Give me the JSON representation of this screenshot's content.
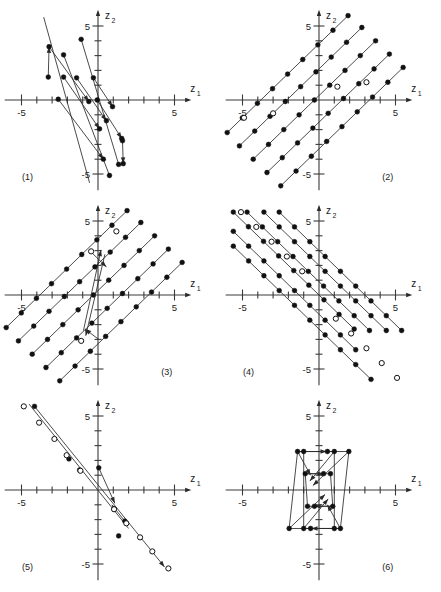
{
  "figure": {
    "title": "",
    "width": 441,
    "height": 592,
    "panel_count": 6,
    "background_color": "#ffffff",
    "ink_color": "#111111"
  },
  "axes_common": {
    "xlabel": "z",
    "xlabel_sub": "1",
    "ylabel": "z",
    "ylabel_sub": "2",
    "xlim": [
      -6.1,
      6.1
    ],
    "ylim": [
      -6.1,
      6.1
    ],
    "xticks": [
      -5,
      -4,
      -3,
      -2,
      -1,
      1,
      2,
      3,
      4,
      5
    ],
    "yticks": [
      -5,
      -4,
      -3,
      -2,
      -1,
      1,
      2,
      3,
      4,
      5
    ],
    "xtick_labels": [
      {
        "value": -5,
        "text": "-5"
      },
      {
        "value": 5,
        "text": "5"
      }
    ],
    "ytick_labels": [
      {
        "value": -5,
        "text": "-5"
      },
      {
        "value": 5,
        "text": "5"
      }
    ],
    "grid": false,
    "origin_centered": true
  },
  "chart_data": [
    {
      "id": "panel-1",
      "type": "scatter",
      "label": "(1)",
      "label_pos": [
        -4.6,
        -5.4
      ],
      "title": "",
      "xlabel": "z1",
      "ylabel": "z2",
      "xlim": [
        -6.1,
        6.1
      ],
      "ylim": [
        -6.1,
        6.1
      ],
      "description": "Steep negative-slope trajectories with filled markers and arrows",
      "segments": [
        {
          "points": [
            [
              -3.55,
              5.6
            ],
            [
              -0.55,
              -5.6
            ]
          ],
          "arrow": false
        },
        {
          "points": [
            [
              -2.25,
              3.05
            ],
            [
              0.75,
              -5.1
            ]
          ],
          "arrow": false
        },
        {
          "points": [
            [
              -1.1,
              4.1
            ],
            [
              1.35,
              -4.35
            ]
          ],
          "arrow": false
        },
        {
          "points": [
            [
              -3.25,
              1.55
            ],
            [
              -3.2,
              3.6
            ]
          ],
          "arrow": true
        },
        {
          "points": [
            [
              1.6,
              -2.75
            ],
            [
              1.65,
              -4.3
            ]
          ],
          "arrow": true
        },
        {
          "points": [
            [
              -3.2,
              3.6
            ],
            [
              -0.6,
              -0.1
            ]
          ],
          "arrow": true
        },
        {
          "points": [
            [
              -2.25,
              1.55
            ],
            [
              0.1,
              -1.95
            ]
          ],
          "arrow": true
        },
        {
          "points": [
            [
              -1.4,
              1.5
            ],
            [
              0.55,
              -1.4
            ]
          ],
          "arrow": true
        },
        {
          "points": [
            [
              -0.3,
              1.5
            ],
            [
              0.95,
              -0.45
            ]
          ],
          "arrow": true
        },
        {
          "points": [
            [
              -2.6,
              0.05
            ],
            [
              0.35,
              -4.0
            ]
          ],
          "arrow": true
        },
        {
          "points": [
            [
              -0.05,
              0.0
            ],
            [
              1.55,
              -2.6
            ]
          ],
          "arrow": true
        }
      ],
      "points_filled": [
        [
          -3.25,
          1.55
        ],
        [
          -3.2,
          3.6
        ],
        [
          -2.25,
          3.05
        ],
        [
          -2.25,
          1.55
        ],
        [
          -1.4,
          1.5
        ],
        [
          -1.1,
          4.1
        ],
        [
          -0.3,
          1.5
        ],
        [
          -0.6,
          -0.1
        ],
        [
          -2.6,
          0.05
        ],
        [
          -0.05,
          0.0
        ],
        [
          0.35,
          -4.0
        ],
        [
          0.55,
          -1.4
        ],
        [
          0.75,
          -5.1
        ],
        [
          0.95,
          -0.45
        ],
        [
          1.35,
          -4.35
        ],
        [
          1.55,
          -2.6
        ],
        [
          1.6,
          -2.75
        ],
        [
          1.65,
          -4.3
        ],
        [
          0.1,
          -1.95
        ]
      ],
      "points_open": []
    },
    {
      "id": "panel-2",
      "type": "scatter",
      "label": "(2)",
      "label_pos": [
        4.5,
        -5.4
      ],
      "title": "",
      "xlabel": "z1",
      "ylabel": "z2",
      "xlim": [
        -6.1,
        6.1
      ],
      "ylim": [
        -6.1,
        6.1
      ],
      "description": "Five parallel lines of slope 1 with unit-spaced filled lattice markers; selected open markers",
      "lines": [
        {
          "from": [
            -6.0,
            -2.2
          ],
          "to": [
            1.9,
            5.7
          ],
          "step": 1.0
        },
        {
          "from": [
            -5.2,
            -3.1
          ],
          "to": [
            2.8,
            4.9
          ],
          "step": 1.0
        },
        {
          "from": [
            -4.3,
            -4.0
          ],
          "to": [
            3.7,
            4.0
          ],
          "step": 1.0
        },
        {
          "from": [
            -3.4,
            -4.9
          ],
          "to": [
            4.6,
            3.1
          ],
          "step": 1.0
        },
        {
          "from": [
            -2.5,
            -5.8
          ],
          "to": [
            5.5,
            2.2
          ],
          "step": 1.0
        }
      ],
      "points_open": [
        [
          -4.9,
          -1.2
        ],
        [
          -3.0,
          -0.9
        ],
        [
          1.2,
          0.9
        ],
        [
          3.1,
          1.2
        ]
      ]
    },
    {
      "id": "panel-3",
      "type": "scatter",
      "label": "(3)",
      "label_pos": [
        4.5,
        -5.4
      ],
      "title": "",
      "xlabel": "z1",
      "ylabel": "z2",
      "xlim": [
        -6.1,
        6.1
      ],
      "ylim": [
        -6.1,
        6.1
      ],
      "description": "Slope-1 lattice lines as in panel 2 plus a narrow steep trajectory pair through origin",
      "lines": [
        {
          "from": [
            -6.0,
            -2.2
          ],
          "to": [
            1.9,
            5.7
          ],
          "step": 1.0
        },
        {
          "from": [
            -5.2,
            -3.1
          ],
          "to": [
            2.8,
            4.9
          ],
          "step": 1.0
        },
        {
          "from": [
            -4.3,
            -4.0
          ],
          "to": [
            3.7,
            4.0
          ],
          "step": 1.0
        },
        {
          "from": [
            -3.4,
            -4.9
          ],
          "to": [
            4.6,
            3.1
          ],
          "step": 1.0
        },
        {
          "from": [
            -2.5,
            -5.8
          ],
          "to": [
            5.5,
            2.2
          ],
          "step": 1.0
        }
      ],
      "points_open": [
        [
          -1.1,
          -3.1
        ],
        [
          -0.45,
          2.95
        ],
        [
          1.2,
          4.3
        ]
      ],
      "segments": [
        {
          "points": [
            [
              -0.95,
              -2.4
            ],
            [
              0.2,
              3.05
            ]
          ],
          "arrow": true
        },
        {
          "points": [
            [
              0.45,
              2.75
            ],
            [
              -0.8,
              -2.75
            ]
          ],
          "arrow": true
        },
        {
          "points": [
            [
              -0.5,
              2.95
            ],
            [
              0.55,
              1.9
            ]
          ],
          "arrow": true
        },
        {
          "points": [
            [
              0.05,
              -3.0
            ],
            [
              -0.85,
              -2.3
            ]
          ],
          "arrow": true
        }
      ]
    },
    {
      "id": "panel-4",
      "type": "scatter",
      "label": "(4)",
      "label_pos": [
        -4.6,
        -5.4
      ],
      "title": "",
      "xlabel": "z1",
      "ylabel": "z2",
      "xlim": [
        -6.1,
        6.1
      ],
      "ylim": [
        -6.1,
        6.1
      ],
      "description": "Five parallel lines of slope -1 with unit-spaced filled lattice markers; diagonal band of open markers",
      "lines": [
        {
          "from": [
            -5.6,
            5.6
          ],
          "to": [
            2.3,
            -2.3
          ],
          "step": 1.0
        },
        {
          "from": [
            -4.7,
            5.6
          ],
          "to": [
            3.3,
            -2.4
          ],
          "step": 1.0
        },
        {
          "from": [
            -5.6,
            4.3
          ],
          "to": [
            2.4,
            -3.7
          ],
          "step": 1.0
        },
        {
          "from": [
            -5.6,
            3.3
          ],
          "to": [
            3.4,
            -5.7
          ],
          "step": 1.0
        },
        {
          "from": [
            -3.6,
            5.6
          ],
          "to": [
            4.4,
            -2.4
          ],
          "step": 1.0
        },
        {
          "from": [
            -2.6,
            5.6
          ],
          "to": [
            5.4,
            -2.4
          ],
          "step": 1.0
        }
      ],
      "points_open": [
        [
          -5.1,
          5.6
        ],
        [
          -4.1,
          4.6
        ],
        [
          -3.1,
          3.6
        ],
        [
          -2.1,
          2.6
        ],
        [
          -1.1,
          1.6
        ],
        [
          1.1,
          -1.6
        ],
        [
          2.1,
          -2.6
        ],
        [
          3.1,
          -3.6
        ],
        [
          4.1,
          -4.6
        ],
        [
          5.1,
          -5.6
        ]
      ]
    },
    {
      "id": "panel-5",
      "type": "scatter",
      "label": "(5)",
      "label_pos": [
        -4.6,
        -5.4
      ],
      "title": "",
      "xlabel": "z1",
      "ylabel": "z2",
      "xlim": [
        -6.1,
        6.1
      ],
      "ylim": [
        -6.1,
        6.1
      ],
      "description": "Negative-slope line of open markers from upper-left to lower-right, with shorter filled-marker trajectory and arrows",
      "segments": [
        {
          "points": [
            [
              -4.15,
              5.65
            ],
            [
              4.35,
              -5.2
            ]
          ],
          "arrow": true
        },
        {
          "points": [
            [
              -4.5,
              5.8
            ],
            [
              2.0,
              -2.6
            ]
          ],
          "arrow": false
        },
        {
          "points": [
            [
              0.05,
              1.5
            ],
            [
              1.1,
              -0.9
            ]
          ],
          "arrow": true
        },
        {
          "points": [
            [
              1.75,
              -2.1
            ],
            [
              0.9,
              -1.0
            ]
          ],
          "arrow": true
        }
      ],
      "points_open": [
        [
          -4.85,
          5.65
        ],
        [
          -3.85,
          4.55
        ],
        [
          -2.85,
          3.45
        ],
        [
          -2.05,
          2.35
        ],
        [
          -1.15,
          1.3
        ],
        [
          1.05,
          -1.3
        ],
        [
          1.85,
          -2.25
        ],
        [
          2.75,
          -3.2
        ],
        [
          3.55,
          -4.15
        ],
        [
          4.6,
          -5.3
        ]
      ],
      "points_filled": [
        [
          -4.15,
          5.65
        ],
        [
          -1.9,
          2.1
        ],
        [
          -1.2,
          1.35
        ],
        [
          0.05,
          1.5
        ],
        [
          1.05,
          -1.3
        ],
        [
          1.75,
          -2.1
        ],
        [
          1.35,
          -3.1
        ]
      ]
    },
    {
      "id": "panel-6",
      "type": "scatter",
      "label": "(6)",
      "label_pos": [
        4.5,
        -5.4
      ],
      "title": "",
      "xlabel": "z1",
      "ylabel": "z2",
      "xlim": [
        -6.1,
        6.1
      ],
      "ylim": [
        -6.1,
        6.1
      ],
      "description": "Two nested parallelograms centered near the origin with directional arrows on edges and diagonals",
      "polygons": [
        {
          "points": [
            [
              -1.4,
              2.6
            ],
            [
              1.95,
              2.6
            ],
            [
              1.4,
              -2.6
            ],
            [
              -1.95,
              -2.6
            ]
          ],
          "closed": true
        },
        {
          "points": [
            [
              -1.0,
              2.6
            ],
            [
              1.0,
              2.6
            ],
            [
              1.0,
              -2.6
            ],
            [
              -1.0,
              -2.6
            ]
          ],
          "closed": true
        },
        {
          "points": [
            [
              -0.9,
              1.1
            ],
            [
              0.75,
              1.1
            ],
            [
              0.9,
              -1.1
            ],
            [
              -0.75,
              -1.1
            ]
          ],
          "closed": true
        }
      ],
      "segments": [
        {
          "points": [
            [
              -1.4,
              2.6
            ],
            [
              0.5,
              2.6
            ]
          ],
          "arrow": true
        },
        {
          "points": [
            [
              1.4,
              -2.6
            ],
            [
              -0.5,
              -2.6
            ]
          ],
          "arrow": true
        },
        {
          "points": [
            [
              -0.9,
              1.1
            ],
            [
              0.3,
              1.1
            ]
          ],
          "arrow": true
        },
        {
          "points": [
            [
              0.9,
              -1.1
            ],
            [
              -0.3,
              -1.1
            ]
          ],
          "arrow": true
        },
        {
          "points": [
            [
              1.95,
              2.6
            ],
            [
              -0.4,
              0.3
            ]
          ],
          "arrow": true
        },
        {
          "points": [
            [
              -1.95,
              -2.6
            ],
            [
              0.4,
              -0.3
            ]
          ],
          "arrow": true
        },
        {
          "points": [
            [
              1.0,
              2.6
            ],
            [
              -0.6,
              0.6
            ]
          ],
          "arrow": true
        },
        {
          "points": [
            [
              -1.0,
              -2.6
            ],
            [
              0.6,
              -0.6
            ]
          ],
          "arrow": true
        },
        {
          "points": [
            [
              -1.4,
              2.6
            ],
            [
              -0.55,
              1.0
            ]
          ],
          "arrow": true
        },
        {
          "points": [
            [
              1.4,
              -2.6
            ],
            [
              0.55,
              -1.0
            ]
          ],
          "arrow": true
        }
      ],
      "points_filled": [
        [
          -1.4,
          2.6
        ],
        [
          1.95,
          2.6
        ],
        [
          1.4,
          -2.6
        ],
        [
          -1.95,
          -2.6
        ],
        [
          -1.0,
          2.6
        ],
        [
          1.0,
          2.6
        ],
        [
          1.0,
          -2.6
        ],
        [
          -1.0,
          -2.6
        ],
        [
          -0.9,
          1.1
        ],
        [
          0.75,
          1.1
        ],
        [
          0.9,
          -1.1
        ],
        [
          -0.75,
          -1.1
        ],
        [
          0.55,
          2.6
        ],
        [
          -0.55,
          -2.6
        ],
        [
          0.3,
          1.1
        ],
        [
          -0.3,
          -1.1
        ]
      ]
    }
  ]
}
